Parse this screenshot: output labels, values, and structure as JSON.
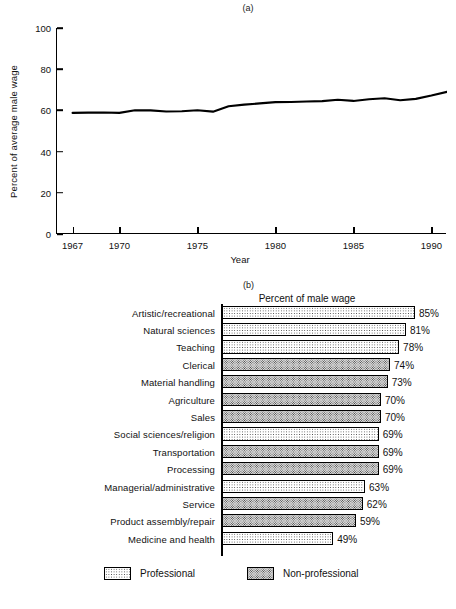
{
  "figure": {
    "panel_a_caption": "(a)",
    "panel_b_caption": "(b)"
  },
  "chart_data": [
    {
      "type": "line",
      "panel": "(a)",
      "title": "",
      "xlabel": "Year",
      "ylabel": "Percent of average male wage",
      "xlim": [
        1966,
        1991
      ],
      "ylim": [
        0,
        100
      ],
      "grid": false,
      "legend": "none",
      "ytick_labels": [
        "0",
        "20",
        "40",
        "60",
        "80",
        "100"
      ],
      "yticks": [
        0,
        20,
        40,
        60,
        80,
        100
      ],
      "xtick_labels": [
        "1967",
        "1970",
        "1975",
        "1980",
        "1985",
        "1990"
      ],
      "xticks": [
        1967,
        1970,
        1975,
        1980,
        1985,
        1990
      ],
      "x": [
        1967,
        1968,
        1969,
        1970,
        1971,
        1972,
        1973,
        1974,
        1975,
        1976,
        1977,
        1978,
        1979,
        1980,
        1981,
        1982,
        1983,
        1984,
        1985,
        1986,
        1987,
        1988,
        1989,
        1990,
        1991
      ],
      "values": [
        58.8,
        58.9,
        59.0,
        58.8,
        60.1,
        60.0,
        59.5,
        59.6,
        60.1,
        59.4,
        62.0,
        62.8,
        63.4,
        64.0,
        64.1,
        64.3,
        64.5,
        65.2,
        64.6,
        65.4,
        65.9,
        64.9,
        65.6,
        67.2,
        69.0
      ]
    },
    {
      "type": "bar",
      "orientation": "horizontal",
      "panel": "(b)",
      "title": "Percent of male wage",
      "xlabel": "",
      "ylabel": "",
      "xlim": [
        0,
        100
      ],
      "grid": false,
      "legend_position": "bottom",
      "legend": [
        {
          "key": "professional",
          "label": "Professional"
        },
        {
          "key": "nonprofessional",
          "label": "Non-professional"
        }
      ],
      "categories": [
        "Artistic/recreational",
        "Natural sciences",
        "Teaching",
        "Clerical",
        "Material handling",
        "Agriculture",
        "Sales",
        "Social sciences/religion",
        "Transportation",
        "Processing",
        "Managerial/administrative",
        "Service",
        "Product assembly/repair",
        "Medicine and health"
      ],
      "values": [
        85,
        81,
        78,
        74,
        73,
        70,
        70,
        69,
        69,
        69,
        63,
        62,
        59,
        49
      ],
      "value_labels": [
        "85%",
        "81%",
        "78%",
        "74%",
        "73%",
        "70%",
        "70%",
        "69%",
        "69%",
        "69%",
        "63%",
        "62%",
        "59%",
        "49%"
      ],
      "groups": [
        "professional",
        "professional",
        "professional",
        "nonprofessional",
        "nonprofessional",
        "nonprofessional",
        "nonprofessional",
        "professional",
        "nonprofessional",
        "nonprofessional",
        "professional",
        "nonprofessional",
        "nonprofessional",
        "professional"
      ]
    }
  ],
  "colors": {
    "ink": "#111111",
    "axis": "#000000",
    "professional_fill": "#ffffff",
    "nonprofessional_fill": "#d8d8d8"
  }
}
